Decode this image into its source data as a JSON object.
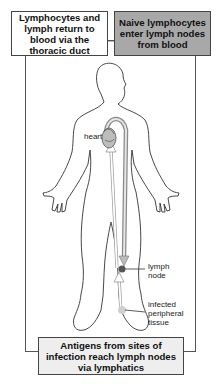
{
  "diagram": {
    "type": "lymphocyte-circulation-body-diagram",
    "boxes": {
      "top_left": "Lymphocytes and lymph return to blood via the thoracic duct",
      "top_right": "Naive lymphocytes enter lymph nodes from blood",
      "bottom": "Antigens from sites of infection reach lymph nodes via lymphatics"
    },
    "labels": {
      "heart": "heart",
      "lymph_node_line1": "lymph",
      "lymph_node_line2": "node",
      "infected_line1": "infected",
      "infected_line2": "peripheral",
      "infected_line3": "tissue"
    },
    "colors": {
      "top_right_box_fill": "#a8a8a8",
      "bottom_box_fill": "#eeeeee",
      "blood_vessel": "#9a9a9a",
      "lymph_node": "#555555",
      "infected_tissue": "#c8c8c8"
    }
  }
}
